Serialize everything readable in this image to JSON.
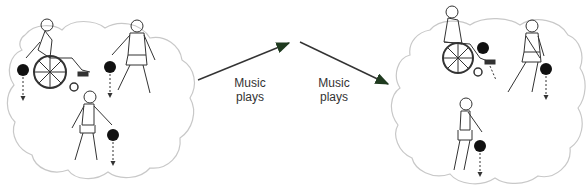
{
  "diagram": {
    "colors": {
      "cloud_outline": "#c8c8c8",
      "figure_stroke": "#333333",
      "ball": "#111111",
      "arrow": "#333333",
      "arrow_head": "#1f3a1f",
      "text": "#333333"
    },
    "left_group": {
      "figures": [
        {
          "type": "wheelchair-user",
          "action": "dropping ball"
        },
        {
          "type": "standing-person",
          "action": "dropping ball"
        },
        {
          "type": "walking-person",
          "action": "dropping ball"
        }
      ]
    },
    "right_group": {
      "figures": [
        {
          "type": "wheelchair-user",
          "action": "dropping ball"
        },
        {
          "type": "standing-person",
          "action": "dropping ball behind back"
        },
        {
          "type": "walking-person",
          "action": "dropping ball"
        }
      ]
    },
    "arrows": [
      {
        "label_line1": "Music",
        "label_line2": "plays",
        "direction": "up-right"
      },
      {
        "label_line1": "Music",
        "label_line2": "plays",
        "direction": "down-right"
      }
    ]
  }
}
